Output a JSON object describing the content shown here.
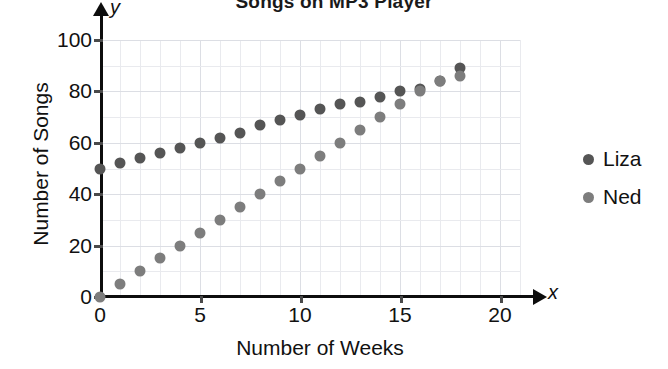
{
  "chart_data": {
    "type": "scatter",
    "title": "Songs on MP3 Player",
    "xlabel": "Number of Weeks",
    "ylabel": "Number of Songs",
    "x_axis_letter": "x",
    "y_axis_letter": "y",
    "xlim": [
      0,
      21
    ],
    "ylim": [
      0,
      100
    ],
    "xticks": [
      0,
      5,
      10,
      15,
      20
    ],
    "yticks": [
      0,
      20,
      40,
      60,
      80,
      100
    ],
    "xtick_labels": [
      "0",
      "5",
      "10",
      "15",
      "20"
    ],
    "ytick_labels": [
      "0",
      "20",
      "40",
      "60",
      "80",
      "100"
    ],
    "grid": true,
    "grid_minor_x_step": 1,
    "grid_minor_y_step": 10,
    "legend_position": "right",
    "x": [
      0,
      1,
      2,
      3,
      4,
      5,
      6,
      7,
      8,
      9,
      10,
      11,
      12,
      13,
      14,
      15,
      16,
      17,
      18
    ],
    "series": [
      {
        "name": "Liza",
        "color": "#555555",
        "values": [
          50,
          52,
          54,
          56,
          58,
          60,
          62,
          64,
          67,
          69,
          71,
          73,
          75,
          76,
          78,
          80,
          81,
          84,
          89
        ]
      },
      {
        "name": "Ned",
        "color": "#7d7d7d",
        "values": [
          0,
          5,
          10,
          15,
          20,
          25,
          30,
          35,
          40,
          45,
          50,
          55,
          60,
          65,
          70,
          75,
          80,
          84,
          86
        ]
      }
    ]
  },
  "legend": {
    "items": [
      {
        "label": "Liza",
        "color": "#555555"
      },
      {
        "label": "Ned",
        "color": "#7d7d7d"
      }
    ]
  }
}
